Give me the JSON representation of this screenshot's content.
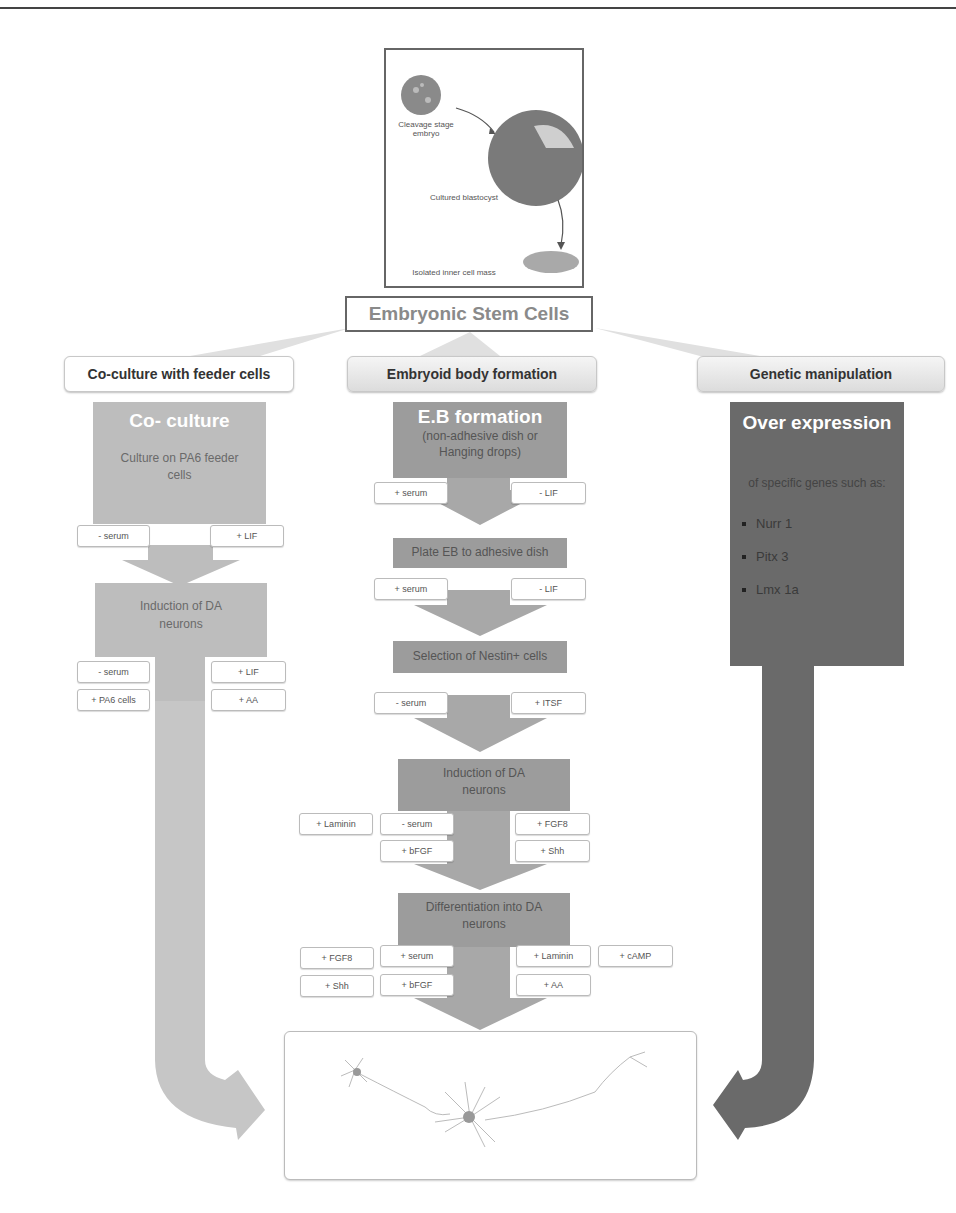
{
  "diagram": {
    "origin": {
      "labels": {
        "cleavage": "Cleavage stage embryo",
        "blastocyst": "Cultured blastocyst",
        "icm": "Isolated inner cell mass"
      }
    },
    "root_title": "Embryonic Stem Cells",
    "branches": [
      {
        "title": "Co-culture with feeder cells",
        "stages": [
          {
            "heading": "Co- culture",
            "text": "Culture on PA6 feeder cells",
            "left_factors": [
              "- serum"
            ],
            "right_factors": [
              "+ LIF"
            ]
          },
          {
            "text": "Induction of DA neurons",
            "left_factors": [
              "- serum",
              "+ PA6 cells"
            ],
            "right_factors": [
              "+ LIF",
              "+ AA"
            ]
          }
        ]
      },
      {
        "title": "Embryoid body formation",
        "stages": [
          {
            "heading": "E.B formation",
            "text": "(non-adhesive dish or Hanging drops)",
            "left_factors": [
              "+ serum"
            ],
            "right_factors": [
              "- LIF"
            ]
          },
          {
            "text": "Plate EB to adhesive dish",
            "left_factors": [
              "+ serum"
            ],
            "right_factors": [
              "- LIF"
            ]
          },
          {
            "text": "Selection of Nestin+ cells",
            "left_factors": [
              "- serum"
            ],
            "right_factors": [
              "+ ITSF"
            ]
          },
          {
            "text": "Induction of DA neurons",
            "outer_left_factors": [
              "+ Laminin"
            ],
            "left_factors": [
              "- serum",
              "+ bFGF"
            ],
            "right_factors": [
              "+ FGF8",
              "+ Shh"
            ]
          },
          {
            "text": "Differentiation into DA neurons",
            "outer_left_factors": [
              "+ FGF8",
              "+ Shh"
            ],
            "left_factors": [
              "+ serum",
              "+ bFGF"
            ],
            "right_factors": [
              "+ Laminin",
              "+ AA"
            ],
            "outer_right_factors": [
              "+ cAMP"
            ]
          }
        ]
      },
      {
        "title": "Genetic manipulation",
        "stages": [
          {
            "heading": "Over expression",
            "text": "of specific genes such as:",
            "genes": [
              "Nurr 1",
              "Pitx 3",
              "Lmx 1a"
            ]
          }
        ]
      }
    ],
    "endpoint": "dopaminergic-neuron-illustration",
    "colors": {
      "coculture_arrow": "#bdbdbd",
      "eb_arrow": "#9c9c9c",
      "genetic_arrow": "#6a6a6a",
      "root_text": "#8a8a8a"
    }
  }
}
